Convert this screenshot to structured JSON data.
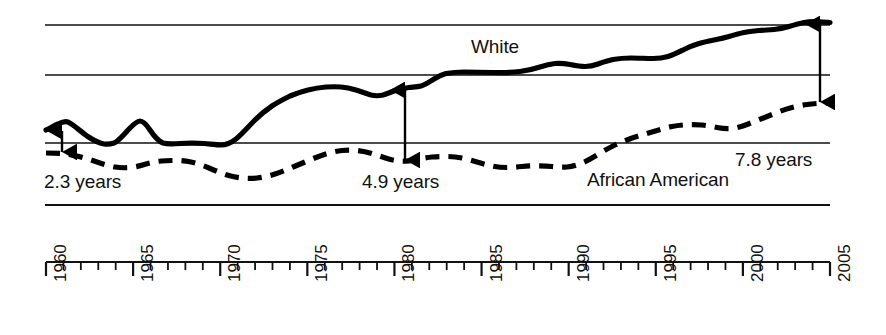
{
  "chart_data": {
    "type": "line",
    "title": "",
    "subtitle": "",
    "xlabel": "",
    "ylabel": "",
    "xlim": [
      1960,
      2005
    ],
    "ylim": [
      0,
      100
    ],
    "grid": true,
    "grid_lines": [
      100,
      78.5,
      49.5,
      23
    ],
    "legend_position": "inline-annotations",
    "x": [
      1960,
      1961,
      1962,
      1963,
      1964,
      1965,
      1966,
      1967,
      1968,
      1969,
      1970,
      1971,
      1972,
      1973,
      1974,
      1975,
      1976,
      1977,
      1978,
      1979,
      1980,
      1981,
      1982,
      1983,
      1984,
      1985,
      1986,
      1987,
      1988,
      1989,
      1990,
      1991,
      1992,
      1993,
      1994,
      1995,
      1996,
      1997,
      1998,
      1999,
      2000,
      2001,
      2002,
      2003,
      2004,
      2005
    ],
    "series": [
      {
        "name": "White",
        "style": "solid",
        "color": "#000000",
        "values": [
          70.6,
          71.0,
          70.8,
          70.7,
          70.9,
          71.0,
          70.9,
          71.1,
          70.8,
          71.1,
          71.0,
          71.3,
          71.2,
          71.4,
          72.0,
          72.6,
          72.9,
          73.3,
          73.5,
          74.0,
          74.4,
          74.8,
          75.0,
          75.0,
          75.2,
          75.3,
          75.4,
          75.6,
          75.6,
          75.9,
          76.1,
          76.3,
          76.5,
          76.3,
          76.5,
          76.5,
          76.8,
          77.1,
          77.3,
          77.3,
          77.6,
          77.7,
          77.7,
          78.0,
          78.3,
          78.3
        ]
      },
      {
        "name": "African American",
        "style": "dashed",
        "color": "#000000",
        "values": [
          68.3,
          68.2,
          68.4,
          68.1,
          68.3,
          68.3,
          68.0,
          68.2,
          68.0,
          68.1,
          67.5,
          67.6,
          67.4,
          67.5,
          68.2,
          68.6,
          68.9,
          69.2,
          69.3,
          69.8,
          69.5,
          70.0,
          70.3,
          70.3,
          70.1,
          69.9,
          69.7,
          69.6,
          69.4,
          69.2,
          69.4,
          69.5,
          69.9,
          69.4,
          69.7,
          69.8,
          70.3,
          71.1,
          71.3,
          71.5,
          71.9,
          72.1,
          72.3,
          72.7,
          73.1,
          73.1
        ]
      }
    ],
    "annotations": [
      {
        "id": "gap-1960",
        "label": "2.3 years",
        "year": 1960,
        "value": 2.3,
        "type": "double-arrow"
      },
      {
        "id": "gap-1980",
        "label": "4.9 years",
        "year": 1980,
        "value": 4.9,
        "type": "double-arrow"
      },
      {
        "id": "gap-2005",
        "label": "7.8 years",
        "year": 2005,
        "value": 7.8,
        "type": "double-arrow"
      }
    ],
    "series_labels": [
      {
        "id": "white-label",
        "text": "White"
      },
      {
        "id": "african-american-label",
        "text": "African American"
      }
    ],
    "axis": {
      "tick_interval_minor": 1,
      "tick_interval_major": 5,
      "tick_labels": [
        "1960",
        "1965",
        "1970",
        "1975",
        "1980",
        "1985",
        "1990",
        "1995",
        "2000",
        "2005"
      ],
      "tick_label_rotation": -90,
      "tick_label_years": [
        1960,
        1965,
        1970,
        1975,
        1980,
        1985,
        1990,
        1995,
        2000,
        2005
      ]
    }
  },
  "labels": {
    "white": "White",
    "african_american": "African American",
    "gap_1960": "2.3 years",
    "gap_1980": "4.9 years",
    "gap_2005": "7.8 years"
  },
  "axis_ticks": {
    "t1960": "1960",
    "t1965": "1965",
    "t1970": "1970",
    "t1975": "1975",
    "t1980": "1980",
    "t1985": "1985",
    "t1990": "1990",
    "t1995": "1995",
    "t2000": "2000",
    "t2005": "2005"
  },
  "colors": {
    "ink": "#000000",
    "background": "#ffffff",
    "gridline": "#1a1a1a"
  }
}
